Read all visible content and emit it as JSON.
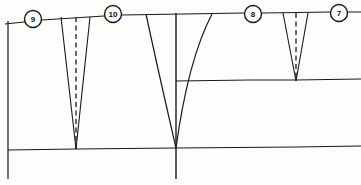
{
  "figure": {
    "kind": "cross-section-diagram",
    "canvas": {
      "width": 361,
      "height": 185
    },
    "background_color": "#fdfdfc",
    "line_color": "#1a1a1a"
  },
  "station_markers": [
    {
      "id": "marker-9",
      "label": "9",
      "cx": 33,
      "cy": 19,
      "r": 8.5
    },
    {
      "id": "marker-10",
      "label": "10",
      "cx": 113,
      "cy": 14,
      "r": 8.5
    },
    {
      "id": "marker-8",
      "label": "8",
      "cx": 253,
      "cy": 14,
      "r": 8.5
    },
    {
      "id": "marker-7",
      "label": "7",
      "cx": 339,
      "cy": 13,
      "r": 8.5
    }
  ],
  "surface_line": {
    "name": "ground-surface",
    "points": "5,24 24,22 42,20 104,16 122,15 244,13 262,13 331,12 348,12 361,12"
  },
  "strata_lines": [
    {
      "name": "mid-stratum-line",
      "points": "176,81 250,80 296,80 361,79"
    },
    {
      "name": "lower-stratum-line",
      "points": "8,150 76,149 176,148 296,147 361,146"
    }
  ],
  "borders": [
    {
      "name": "left-border",
      "points": "8,21 8,179"
    },
    {
      "name": "axis-vertical-center",
      "points": "176,13 176,179"
    }
  ],
  "wedges": [
    {
      "name": "wedge-left",
      "style": "straight-sided",
      "has_dashed_axis": true,
      "top_left_x": 61,
      "top_right_x": 90,
      "top_y": 17,
      "apex_x": 76,
      "apex_y": 149,
      "left_edge": "61,17 76,149",
      "right_edge": "90,17 76,149",
      "dashed_axis": "76,17 76,149"
    },
    {
      "name": "wedge-center",
      "style": "curved-sided",
      "has_dashed_axis": false,
      "top_left_x": 146,
      "top_right_x": 212,
      "top_y": 14,
      "apex_x": 176,
      "apex_y": 148,
      "left_edge": "M146,14 Q158,70 176,148",
      "right_edge": "M212,14 Q188,60 176,148"
    },
    {
      "name": "wedge-right",
      "style": "straight-sided",
      "has_dashed_axis": true,
      "top_left_x": 283,
      "top_right_x": 308,
      "top_y": 13,
      "apex_x": 296,
      "apex_y": 81,
      "left_edge": "283,13 296,81",
      "right_edge": "308,13 296,81",
      "dashed_axis": "296,13 296,81"
    }
  ]
}
